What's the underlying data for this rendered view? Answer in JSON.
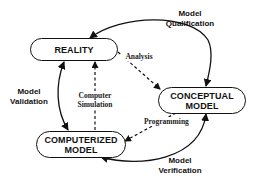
{
  "diagram": {
    "nodes": {
      "reality": {
        "lines": [
          "REALITY"
        ]
      },
      "conceptual": {
        "lines": [
          "CONCEPTUAL",
          "MODEL"
        ]
      },
      "computerized": {
        "lines": [
          "COMPUTERIZED",
          "MODEL"
        ]
      }
    },
    "solid_arcs": {
      "qualification": {
        "lines": [
          "Model",
          "Qualification"
        ],
        "from": "reality",
        "to": "conceptual",
        "style": "solid",
        "heads": "both"
      },
      "validation": {
        "lines": [
          "Model",
          "Validation"
        ],
        "from": "reality",
        "to": "computerized",
        "style": "solid",
        "heads": "both"
      },
      "verification": {
        "lines": [
          "Model",
          "Verification"
        ],
        "from": "computerized",
        "to": "conceptual",
        "style": "solid",
        "heads": "both"
      }
    },
    "dashed_arrows": {
      "analysis": {
        "lines": [
          "Analysis"
        ],
        "from": "reality",
        "to": "conceptual",
        "style": "dashed"
      },
      "programming": {
        "lines": [
          "Programming"
        ],
        "from": "conceptual",
        "to": "computerized",
        "style": "dashed"
      },
      "simulation": {
        "lines": [
          "Computer",
          "Simulation"
        ],
        "from": "computerized",
        "to": "reality",
        "style": "dashed"
      }
    }
  }
}
